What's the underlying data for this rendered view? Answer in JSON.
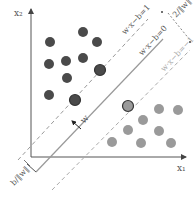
{
  "diagram": {
    "type": "svm-max-margin",
    "axes": {
      "x_label": "x₁",
      "y_label": "x₂",
      "origin": [
        31,
        157
      ]
    },
    "hyperplanes": {
      "decision": "w·x−b=0",
      "positive_margin": "w·x−b=1",
      "negative_margin": "w·x−b=−1"
    },
    "annotations": {
      "margin_width": "2/‖w‖",
      "offset": "b/‖w‖",
      "normal_vector": "w"
    },
    "colors": {
      "dark_class": "#4a4a4a",
      "light_class": "#9a9a9a",
      "axis": "#555555",
      "line": "#888888",
      "support_vector_stroke": "#333333"
    },
    "dark_points": [
      [
        50,
        42
      ],
      [
        83,
        32
      ],
      [
        97,
        42
      ],
      [
        49,
        64
      ],
      [
        66,
        61
      ],
      [
        83,
        58
      ],
      [
        67,
        78
      ],
      [
        49,
        95
      ]
    ],
    "dark_support_vectors": [
      [
        75,
        100
      ],
      [
        100,
        70
      ]
    ],
    "light_points": [
      [
        159,
        109
      ],
      [
        178,
        110
      ],
      [
        143,
        120
      ],
      [
        128,
        130
      ],
      [
        159,
        131
      ],
      [
        112,
        142
      ],
      [
        141,
        143
      ],
      [
        171,
        143
      ]
    ],
    "light_support_vectors": [
      [
        128,
        106
      ]
    ]
  }
}
